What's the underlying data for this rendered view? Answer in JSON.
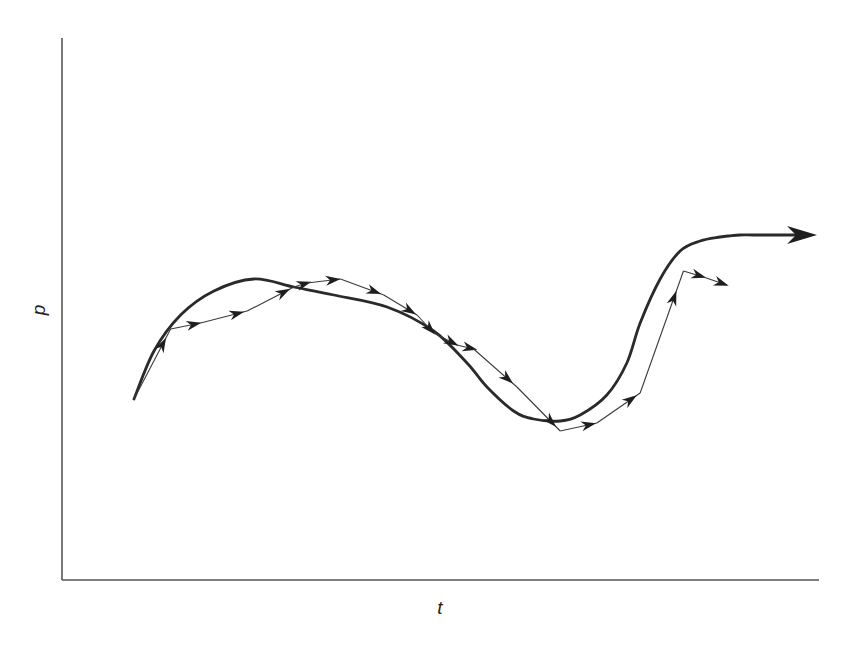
{
  "chart_data": {
    "type": "line",
    "title": "",
    "xlabel": "t",
    "ylabel": "p",
    "xlim": [
      0,
      100
    ],
    "ylim": [
      0,
      100
    ],
    "grid": false,
    "ticks": "none",
    "legend": "none",
    "series": [
      {
        "name": "smooth trajectory",
        "style": "thick smooth curve with arrowhead at end",
        "x": [
          0,
          3,
          7,
          12,
          18,
          24,
          30,
          38,
          45,
          50,
          53,
          57,
          60,
          64,
          67,
          71,
          74,
          76,
          79,
          82,
          85,
          88,
          89.5,
          91,
          93,
          97,
          100
        ],
        "y": [
          33,
          45,
          54,
          60,
          63,
          61,
          59,
          56,
          50,
          42,
          36,
          30,
          28,
          27.5,
          29,
          34,
          42,
          52,
          63,
          70,
          72.5,
          73.5,
          73.8,
          74,
          74,
          74,
          74
        ]
      },
      {
        "name": "stepwise approximation",
        "style": "thin polyline with an arrowhead on each segment",
        "x": [
          0,
          5.5,
          10,
          17,
          24,
          26,
          31,
          37.5,
          42.5,
          45,
          48.5,
          51,
          57.5,
          64,
          69.5,
          76,
          82.5,
          85.5,
          89
        ],
        "y": [
          33,
          50.5,
          52,
          55,
          61,
          62,
          63,
          59,
          54,
          49.5,
          46.5,
          45.5,
          36,
          25,
          27,
          34.5,
          65,
          63.5,
          61.5
        ]
      }
    ]
  }
}
